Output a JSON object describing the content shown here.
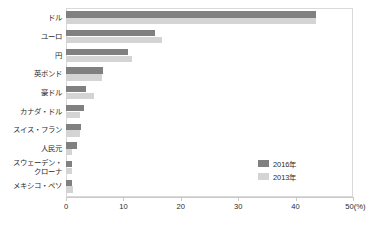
{
  "chart_data": {
    "type": "bar",
    "orientation": "horizontal",
    "title": "",
    "xlabel": "(%)",
    "ylabel": "",
    "xlim": [
      0,
      50
    ],
    "xticks": [
      0,
      10,
      20,
      30,
      40,
      50
    ],
    "xtick_labels": [
      "0",
      "10",
      "20",
      "30",
      "40",
      "50"
    ],
    "x_unit_label": "(%)",
    "x_last_tick_label": "50(%)",
    "grid": false,
    "legend_position": "inside-right-lower",
    "categories": [
      "ドル",
      "ユーロ",
      "円",
      "英ポンド",
      "豪ドル",
      "カナダ・ドル",
      "スイス・フラン",
      "人民元",
      "スウェーデン・\nクローナ",
      "メキシコ・ペソ"
    ],
    "series": [
      {
        "name": "2016年",
        "color": "#808080",
        "values": [
          43.6,
          15.5,
          10.8,
          6.4,
          3.5,
          3.1,
          2.6,
          2.0,
          1.1,
          1.1
        ]
      },
      {
        "name": "2013年",
        "color": "#d4d4d4",
        "values": [
          43.5,
          16.7,
          11.5,
          6.2,
          4.9,
          2.4,
          2.4,
          1.1,
          1.0,
          1.3
        ]
      }
    ]
  },
  "legend": {
    "items": [
      {
        "label": "2016年",
        "color": "#808080"
      },
      {
        "label": "2013年",
        "color": "#d4d4d4"
      }
    ]
  },
  "colors": {
    "series_2016": "#808080",
    "series_2013": "#d4d4d4",
    "axis": "#c9c9c9",
    "frame": "#d9d9d9",
    "text": "#2b2b2b"
  }
}
